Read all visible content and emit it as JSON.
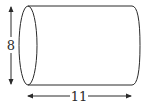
{
  "diagram": {
    "shape": "cylinder",
    "orientation": "horizontal",
    "labels": {
      "height": "8",
      "length": "11"
    },
    "colors": {
      "stroke": "#2a2a2a",
      "background": "#ffffff"
    }
  }
}
